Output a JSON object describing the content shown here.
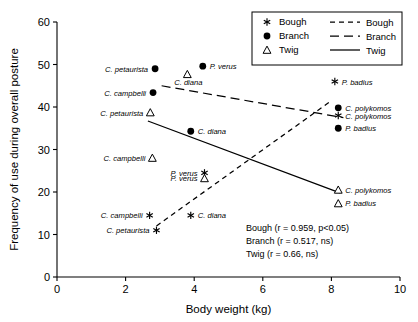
{
  "chart_data": {
    "type": "scatter",
    "title": "",
    "xlabel": "Body weight (kg)",
    "ylabel": "Frequency of use during overall posture",
    "xlim": [
      0,
      10
    ],
    "ylim": [
      0,
      60
    ],
    "xticks": [
      "0",
      "2",
      "4",
      "6",
      "8",
      "10"
    ],
    "yticks": [
      "0",
      "10",
      "20",
      "30",
      "40",
      "50",
      "60"
    ],
    "grid": false,
    "legend_position": "top-right",
    "series": [
      {
        "name": "Bough",
        "marker": "asterisk",
        "points": [
          {
            "label": "C. petaurista",
            "x": 2.9,
            "y": 11.0,
            "label_side": "left"
          },
          {
            "label": "C. campbelli",
            "x": 2.7,
            "y": 14.5,
            "label_side": "left"
          },
          {
            "label": "C. diana",
            "x": 3.9,
            "y": 14.5,
            "label_side": "right"
          },
          {
            "label": "P. verus",
            "x": 4.3,
            "y": 24.5,
            "label_side": "left"
          },
          {
            "label": "C. polykomos",
            "x": 8.2,
            "y": 38.0,
            "label_side": "right"
          },
          {
            "label": "P. badius",
            "x": 8.1,
            "y": 46.0,
            "label_side": "right"
          }
        ]
      },
      {
        "name": "Branch",
        "marker": "filled-circle",
        "points": [
          {
            "label": "C. petaurista",
            "x": 2.86,
            "y": 49.0,
            "label_side": "left"
          },
          {
            "label": "C. campbelli",
            "x": 2.8,
            "y": 43.4,
            "label_side": "left"
          },
          {
            "label": "C. diana",
            "x": 3.9,
            "y": 34.3,
            "label_side": "right"
          },
          {
            "label": "P. verus",
            "x": 4.25,
            "y": 49.6,
            "label_side": "right"
          },
          {
            "label": "C. polykomos",
            "x": 8.2,
            "y": 39.8,
            "label_side": "right"
          },
          {
            "label": "P. badius",
            "x": 8.2,
            "y": 35.0,
            "label_side": "right"
          }
        ]
      },
      {
        "name": "Twig",
        "marker": "open-triangle",
        "points": [
          {
            "label": "C. petaurista",
            "x": 2.72,
            "y": 38.7,
            "label_side": "left"
          },
          {
            "label": "C. campbelli",
            "x": 2.78,
            "y": 28.0,
            "label_side": "left"
          },
          {
            "label": "C. diana",
            "x": 3.8,
            "y": 47.7,
            "label_side": "below"
          },
          {
            "label": "P. verus",
            "x": 4.3,
            "y": 23.2,
            "label_side": "left"
          },
          {
            "label": "C. polykomos",
            "x": 8.2,
            "y": 20.5,
            "label_side": "right"
          },
          {
            "label": "P. badius",
            "x": 8.2,
            "y": 17.3,
            "label_side": "right"
          }
        ]
      }
    ],
    "trendlines": [
      {
        "name": "Bough",
        "style": "dashed",
        "x1": 2.9,
        "y1": 12.0,
        "x2": 8.0,
        "y2": 41.5
      },
      {
        "name": "Branch",
        "style": "long-dashed",
        "x1": 3.05,
        "y1": 45.0,
        "x2": 8.35,
        "y2": 37.5
      },
      {
        "name": "Twig",
        "style": "solid",
        "x1": 2.65,
        "y1": 36.7,
        "x2": 8.25,
        "y2": 19.8
      }
    ],
    "legend": [
      {
        "marker": "asterisk",
        "label": "Bough"
      },
      {
        "marker": "filled-circle",
        "label": "Branch"
      },
      {
        "marker": "open-triangle",
        "label": "Twig"
      }
    ],
    "legend_lines": [
      {
        "style": "dashed",
        "label": "Bough"
      },
      {
        "style": "long-dashed",
        "label": "Branch"
      },
      {
        "style": "solid",
        "label": "Twig"
      }
    ],
    "annotations": [
      "Bough (r = 0.959, p<0.05)",
      "Branch (r = 0.517, ns)",
      "Twig (r = 0.66, ns)"
    ]
  },
  "colors": {
    "axis": "#000000",
    "marker": "#000000",
    "background": "#ffffff"
  }
}
